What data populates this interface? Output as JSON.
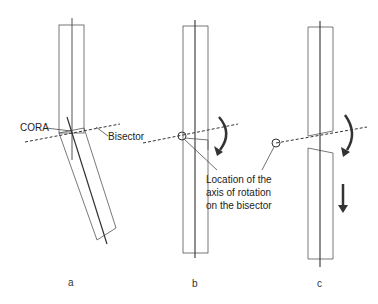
{
  "figure": {
    "panels": [
      {
        "id": "a",
        "caption": "a"
      },
      {
        "id": "b",
        "caption": "b"
      },
      {
        "id": "c",
        "caption": "c"
      }
    ],
    "labels": {
      "cora": "CORA",
      "bisector": "Bisector",
      "axis_line1": "Location of the",
      "axis_line2": "axis of rotation",
      "axis_line3": "on the bisector"
    },
    "colors": {
      "line": "#444444",
      "axis": "#222222",
      "arrow": "#333333",
      "dashed": "#333333"
    }
  }
}
